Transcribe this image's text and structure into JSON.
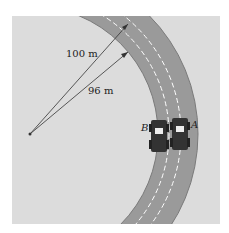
{
  "diagram": {
    "labels": {
      "outer_radius": "100 m",
      "inner_radius": "96 m",
      "car_a": "A",
      "car_b": "B"
    },
    "colors": {
      "background": "#dcdcdc",
      "track": "#9a9a9a",
      "track_edge": "#7a7a7a",
      "lane_dash": "#ffffff",
      "line": "#333333"
    }
  }
}
